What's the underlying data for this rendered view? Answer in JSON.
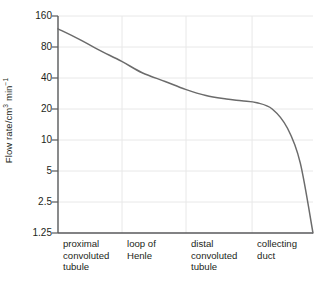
{
  "chart_data": {
    "type": "line",
    "title": "",
    "xlabel": "",
    "ylabel": "Flow rate/cm3 min-1",
    "ylabel_parts": {
      "prefix": "Flow rate/cm",
      "sup1": "3",
      "mid": " min",
      "sup2": "−1"
    },
    "yscale": "log2",
    "ylim": [
      1.25,
      160
    ],
    "yticks": [
      160,
      80,
      40,
      20,
      10,
      5,
      2.5,
      1.25
    ],
    "ytick_labels": [
      "160",
      "80",
      "40",
      "20",
      "10",
      "5",
      "2.5",
      "1.25"
    ],
    "grid": true,
    "grid_horizontal": true,
    "grid_vertical": true,
    "legend": "none",
    "categories": [
      "proximal convoluted tubule",
      "loop of Henle",
      "distal convoluted tubule",
      "collecting duct"
    ],
    "category_label_lines": [
      [
        "proximal",
        "convoluted",
        "tubule"
      ],
      [
        "loop of",
        "Henle"
      ],
      [
        "distal",
        "convoluted",
        "tubule"
      ],
      [
        "collecting",
        "duct"
      ]
    ],
    "series": [
      {
        "name": "Flow rate along the nephron",
        "x": [
          0.0,
          0.08,
          0.16,
          0.25,
          0.33,
          0.42,
          0.5,
          0.58,
          0.66,
          0.72,
          0.78,
          0.84,
          0.9,
          0.95,
          1.0
        ],
        "values": [
          120,
          96,
          75,
          58,
          45,
          37,
          31,
          27,
          25,
          24,
          23,
          20,
          13,
          6.0,
          1.25
        ]
      }
    ],
    "annotations": [],
    "colors": {
      "curve": "#6b6b6b",
      "axis": "#58595b",
      "grid": "#e8e8e8",
      "text": "#231f20",
      "background": "#ffffff"
    }
  }
}
